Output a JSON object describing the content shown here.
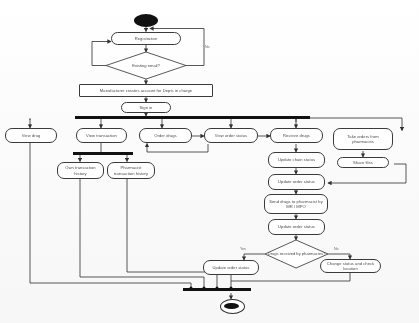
{
  "diagram": {
    "type": "uml-activity-diagram",
    "canvas": {
      "width": 419,
      "height": 323
    },
    "colors": {
      "background": "#fdfdfd",
      "node_border": "#3a3a3a",
      "node_fill": "#ffffff",
      "text": "#4a4a4a",
      "bar": "#111111",
      "edge": "#3a3a3a"
    }
  },
  "nodes": {
    "initial": {
      "label": "",
      "icon": "filled-circle-initial-node"
    },
    "registration": {
      "label": "Registration"
    },
    "existing_email": {
      "label": "Existing email?"
    },
    "manufacturer_creates": {
      "label": "Manufacturer creates account for Depts in charge"
    },
    "sign_in": {
      "label": "Sign in"
    },
    "view_drug": {
      "label": "View drug"
    },
    "view_transaction": {
      "label": "View transaction"
    },
    "own_transaction_history": {
      "label": "Own transaction history"
    },
    "pharmacist_transaction_history": {
      "label": "Pharmacist transaction history"
    },
    "order_drugs": {
      "label": "Order drugs"
    },
    "view_order_status": {
      "label": "View order status"
    },
    "recieve_drugs": {
      "label": "Recieve drugs"
    },
    "update_chain_status": {
      "label": "Update chain status"
    },
    "update_order_status_1": {
      "label": "Update order status"
    },
    "send_drugs": {
      "label": "Send drugs to pharmacist by MR / MPO"
    },
    "update_order_status_2": {
      "label": "Update order status"
    },
    "drugs_received": {
      "label": "Drugs received by pharmacies?"
    },
    "update_order_status_3": {
      "label": "Update order status"
    },
    "change_status": {
      "label": "Change status and check location"
    },
    "take_orders": {
      "label": "Take orders from pharmacies"
    },
    "share_files": {
      "label": "Share files"
    },
    "final": {
      "label": "",
      "icon": "final-node-bullseye"
    }
  },
  "edge_labels": {
    "no_registration": "No",
    "yes_drugs_received": "Yes",
    "no_drugs_received": "No"
  },
  "bars": {
    "fork_main": {
      "name": "fork-bar-main"
    },
    "fork_transaction": {
      "name": "fork-bar-transaction"
    },
    "join_final": {
      "name": "join-bar-final"
    }
  }
}
